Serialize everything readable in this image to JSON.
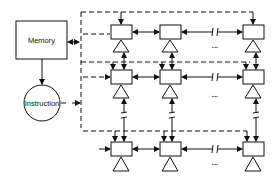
{
  "diagram": {
    "memory": {
      "label": "Memory"
    },
    "instruction": {
      "label": "Instruction"
    },
    "ellipsis": "...",
    "rows": 3,
    "columns_shown": 3,
    "colors": {
      "stroke": "#111111",
      "background": "#ffffff"
    }
  }
}
